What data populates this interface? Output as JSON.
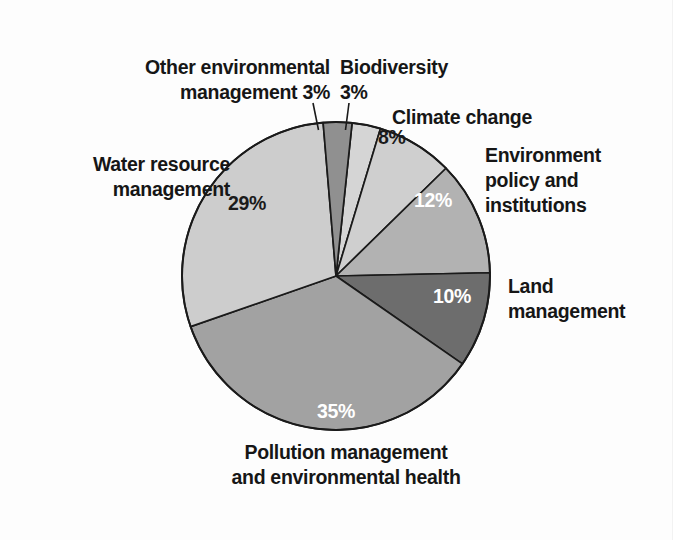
{
  "figure": {
    "kind": "pie-chart",
    "background_color": "#fdfdfd",
    "outline_color": "#1a1a1a"
  },
  "chart_data": {
    "type": "pie",
    "title": "",
    "subtitle": "",
    "xlabel": "",
    "ylabel": "",
    "legend_position": "callout-labels",
    "grid": false,
    "units": "percent",
    "start_angle_deg": -84,
    "direction": "clockwise",
    "categories": [
      "Biodiversity",
      "Climate change",
      "Environment policy and institutions",
      "Land management",
      "Pollution management and environmental health",
      "Water resource management",
      "Other environmental management"
    ],
    "values": [
      3,
      8,
      12,
      10,
      35,
      29,
      3
    ],
    "value_labels": [
      "3%",
      "8%",
      "12%",
      "10%",
      "35%",
      "29%",
      "3%"
    ],
    "colors": [
      "#d5d5d5",
      "#cfcfcf",
      "#b2b2b2",
      "#6d6d6d",
      "#a2a2a2",
      "#cdcdcd",
      "#909090"
    ],
    "slices": [
      {
        "name": "Biodiversity",
        "label": "Biodiversity",
        "value": 3,
        "value_label": "3%",
        "color": "#d5d5d5",
        "label_color": "#161616",
        "value_inside": false,
        "leader_line": true
      },
      {
        "name": "Climate change",
        "label": "Climate change",
        "value": 8,
        "value_label": "8%",
        "color": "#cfcfcf",
        "label_color": "#161616",
        "value_inside": true,
        "leader_line": false
      },
      {
        "name": "Environment policy and institutions",
        "label": "Environment\npolicy and\ninstitutions",
        "value": 12,
        "value_label": "12%",
        "color": "#b2b2b2",
        "label_color": "#161616",
        "value_inside": true,
        "leader_line": false
      },
      {
        "name": "Land management",
        "label": "Land\nmanagement",
        "value": 10,
        "value_label": "10%",
        "color": "#6d6d6d",
        "label_color": "#161616",
        "value_inside": true,
        "leader_line": false
      },
      {
        "name": "Pollution management and environmental health",
        "label": "Pollution management\nand environmental health",
        "value": 35,
        "value_label": "35%",
        "color": "#a2a2a2",
        "label_color": "#161616",
        "value_inside": true,
        "leader_line": false
      },
      {
        "name": "Water resource management",
        "label": "Water resource\nmanagement",
        "value": 29,
        "value_label": "29%",
        "color": "#cdcdcd",
        "label_color": "#161616",
        "value_inside": true,
        "leader_line": false
      },
      {
        "name": "Other environmental management",
        "label": "Other environmental\nmanagement 3%",
        "value": 3,
        "value_label": "3%",
        "color": "#909090",
        "label_color": "#161616",
        "value_inside": false,
        "leader_line": true
      }
    ]
  },
  "labels": {
    "other_environmental_management": "Other environmental\nmanagement 3%",
    "biodiversity": "Biodiversity\n3%",
    "climate_change": "Climate change",
    "environment_policy": "Environment\npolicy and\ninstitutions",
    "land_management": "Land\nmanagement",
    "pollution_management": "Pollution management\nand environmental health",
    "water_resource_management": "Water resource\nmanagement"
  },
  "percent_labels": {
    "climate_change": "8%",
    "environment_policy": "12%",
    "land_management": "10%",
    "pollution_management": "35%",
    "water_resource_management": "29%"
  }
}
